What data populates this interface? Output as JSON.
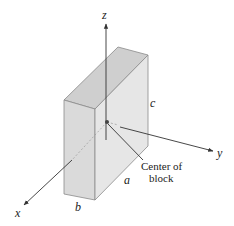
{
  "figure": {
    "type": "isometric rectangular block with coordinate axes",
    "axes": [
      {
        "name": "x",
        "label": "x"
      },
      {
        "name": "y",
        "label": "y"
      },
      {
        "name": "z",
        "label": "z"
      }
    ],
    "dimensions": [
      {
        "name": "a",
        "label": "a",
        "edge": "depth (along y)"
      },
      {
        "name": "b",
        "label": "b",
        "edge": "width (along x)"
      },
      {
        "name": "c",
        "label": "c",
        "edge": "height (along z)"
      }
    ],
    "annotation": {
      "line1": "Center of",
      "line2": "block"
    },
    "colors": {
      "top_face": "#cfcfcf",
      "front_face": "#dddddd",
      "side_face": "#e8e8e8",
      "edges": "#8a8a8a",
      "axes": "#333333"
    }
  }
}
